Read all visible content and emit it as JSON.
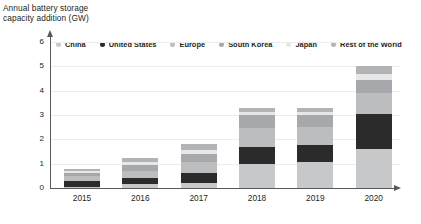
{
  "title": {
    "line1": "Annual battery storage",
    "line2": "capacity addition (GW)"
  },
  "legend": {
    "position": "top",
    "items": [
      {
        "label": "China",
        "color": "#c7c8ca"
      },
      {
        "label": "United States",
        "color": "#2b2b2b"
      },
      {
        "label": "Europe",
        "color": "#bcbdbf"
      },
      {
        "label": "South Korea",
        "color": "#a6a8ab"
      },
      {
        "label": "Japan",
        "color": "#e6e7e8"
      },
      {
        "label": "Rest of the World",
        "color": "#b1b3b5"
      }
    ]
  },
  "chart_data": {
    "type": "bar",
    "stacked": true,
    "title": "Annual battery storage capacity addition (GW)",
    "xlabel": "",
    "ylabel": "GW",
    "ylim": [
      0,
      6
    ],
    "yticks": [
      0,
      1,
      2,
      3,
      4,
      5,
      6
    ],
    "grid": true,
    "categories": [
      "2015",
      "2016",
      "2017",
      "2018",
      "2019",
      "2020"
    ],
    "series": [
      {
        "name": "China",
        "color": "#c7c8ca",
        "values": [
          0.05,
          0.15,
          0.2,
          1.0,
          1.05,
          1.6
        ]
      },
      {
        "name": "United States",
        "color": "#2b2b2b",
        "values": [
          0.25,
          0.25,
          0.4,
          0.7,
          0.7,
          1.45
        ]
      },
      {
        "name": "Europe",
        "color": "#bcbdbf",
        "values": [
          0.2,
          0.3,
          0.45,
          0.75,
          0.75,
          0.85
        ]
      },
      {
        "name": "South Korea",
        "color": "#a6a8ab",
        "values": [
          0.1,
          0.25,
          0.35,
          0.55,
          0.5,
          0.55
        ]
      },
      {
        "name": "Japan",
        "color": "#e6e7e8",
        "values": [
          0.08,
          0.12,
          0.18,
          0.12,
          0.12,
          0.25
        ]
      },
      {
        "name": "Rest of the World",
        "color": "#b1b3b5",
        "values": [
          0.12,
          0.18,
          0.22,
          0.18,
          0.18,
          0.3
        ]
      }
    ],
    "totals": [
      0.8,
      1.25,
      1.8,
      3.3,
      3.3,
      5.0
    ]
  },
  "axis": {
    "arrow_x": "right",
    "arrow_y": "up"
  }
}
